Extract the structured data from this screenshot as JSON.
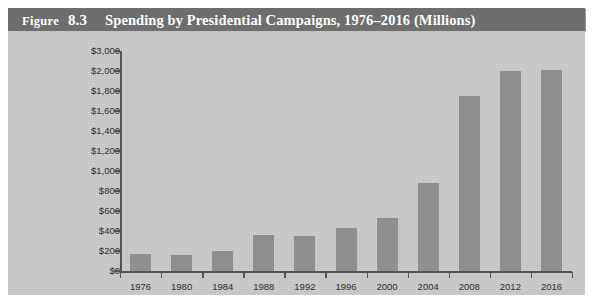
{
  "figure": {
    "label_word": "Figure",
    "number": "8.3",
    "title": "Spending by Presidential Campaigns, 1976–2016 (Millions)",
    "full_title": "Figure 8.3   Spending by Presidential Campaigns, 1976–2016 (Millions)"
  },
  "colors": {
    "title_bar": "#6e6e6e",
    "title_text": "#ffffff",
    "panel": "#c9c9c9",
    "bar": "#8f8f8f",
    "axis": "#555555",
    "tick_text": "#2e2e2e",
    "page": "#ffffff"
  },
  "chart_data": {
    "type": "bar",
    "title": "Spending by Presidential Campaigns, 1976–2016 (Millions)",
    "xlabel": "",
    "ylabel": "",
    "categories": [
      "1976",
      "1980",
      "1984",
      "1988",
      "1992",
      "1996",
      "2000",
      "2004",
      "2008",
      "2012",
      "2016"
    ],
    "values": [
      170,
      162,
      202,
      365,
      355,
      430,
      529,
      881,
      1750,
      2000,
      2050
    ],
    "ytick_labels": [
      "$3,000",
      "$2,000",
      "$1,800",
      "$1,600",
      "$1,400",
      "$1,200",
      "$1,000",
      "$800",
      "$600",
      "$400",
      "$200",
      "$0"
    ],
    "ytick_values": [
      3000,
      2000,
      1800,
      1600,
      1400,
      1200,
      1000,
      800,
      600,
      400,
      200,
      0
    ],
    "ylim": [
      0,
      3000
    ],
    "axis_note": "y-axis is non-linear: evenly spaced ticks every $200 from $0 to $2,000, then a single step to $3,000",
    "grid": false,
    "legend": "none",
    "series": [
      {
        "name": "Campaign spending (millions)",
        "values": [
          170,
          162,
          202,
          365,
          355,
          430,
          529,
          881,
          1750,
          2000,
          2050
        ]
      }
    ]
  }
}
